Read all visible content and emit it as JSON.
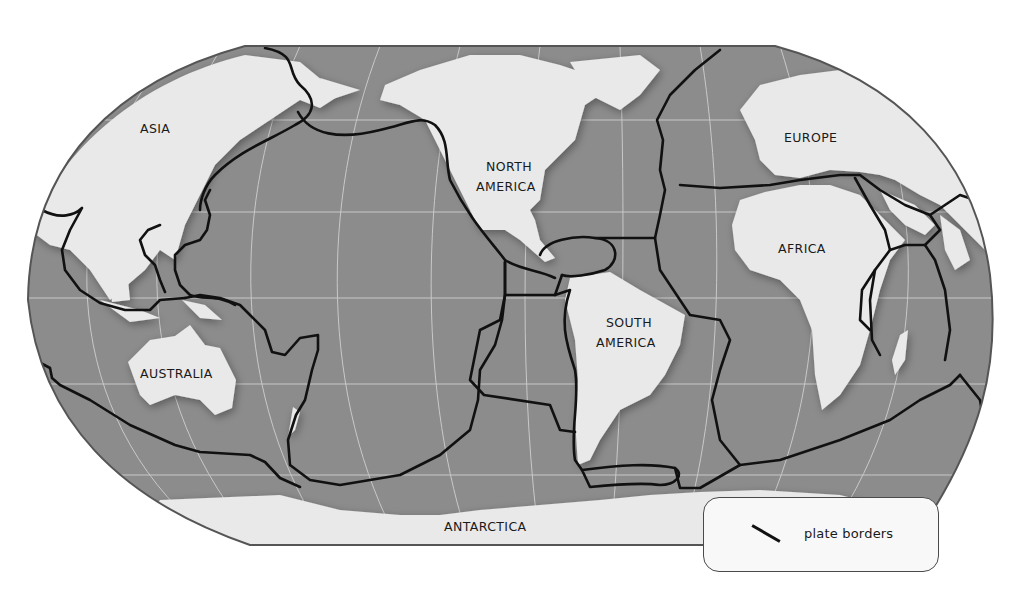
{
  "map": {
    "title": "Tectonic plate borders world map",
    "projection": "Robinson-like (flat poles)",
    "colors": {
      "ocean": "#8c8c8c",
      "land": "#e9e9e9",
      "plate_border": "#111111",
      "graticule": "#d8d8d8",
      "outline": "#555555",
      "background": "#ffffff"
    },
    "labels": {
      "asia": "ASIA",
      "north_america": [
        "NORTH",
        "AMERICA"
      ],
      "europe": "EUROPE",
      "africa": "AFRICA",
      "south_america": [
        "SOUTH",
        "AMERICA"
      ],
      "australia": "AUSTRALIA",
      "antarctica": "ANTARCTICA"
    }
  },
  "legend": {
    "symbol": "plate-border-line",
    "label": "plate borders"
  }
}
